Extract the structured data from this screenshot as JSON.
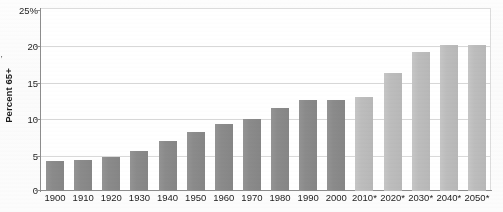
{
  "chart_data": {
    "type": "bar",
    "title": "",
    "xlabel": "",
    "ylabel": "Percent 65+",
    "ylim": [
      0,
      25
    ],
    "ytick_labels": [
      "0",
      "5",
      "10",
      "15",
      "20",
      "25%"
    ],
    "ytick_values": [
      0,
      5,
      10,
      15,
      20,
      25
    ],
    "grid": true,
    "legend": null,
    "categories": [
      "1900",
      "1910",
      "1920",
      "1930",
      "1940",
      "1950",
      "1960",
      "1970",
      "1980",
      "1990",
      "2000",
      "2010*",
      "2020*",
      "2030*",
      "2040*",
      "2050*"
    ],
    "values": [
      4.1,
      4.3,
      4.6,
      5.4,
      6.8,
      8.1,
      9.2,
      9.8,
      11.3,
      12.5,
      12.4,
      12.9,
      16.1,
      19.0,
      20.0,
      20.0
    ],
    "bar_kinds": [
      "historical",
      "historical",
      "historical",
      "historical",
      "historical",
      "historical",
      "historical",
      "historical",
      "historical",
      "historical",
      "historical",
      "projected",
      "projected",
      "projected",
      "projected",
      "projected"
    ],
    "note_marker": "*",
    "colors": {
      "historical_bar": "#8b8b8b",
      "projected_bar": "#bdbdbd",
      "gridline": "#d9d9d9",
      "axis": "#8d8d8d",
      "text": "#1d1d1d",
      "plot_background": "#ffffff",
      "page_background": "#fcfcfc"
    }
  }
}
